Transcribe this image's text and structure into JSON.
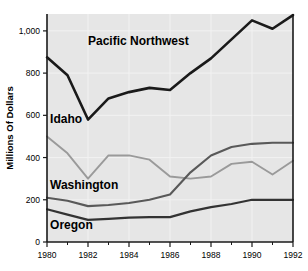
{
  "chart_data": {
    "type": "line",
    "title": "",
    "xlabel": "",
    "ylabel": "Millions Of Dollars",
    "x": [
      1980,
      1981,
      1982,
      1983,
      1984,
      1985,
      1986,
      1987,
      1988,
      1989,
      1990,
      1991,
      1992
    ],
    "xlim": [
      1980,
      1992
    ],
    "ylim": [
      0,
      1080
    ],
    "grid": true,
    "legend_position": "inline-labels",
    "y_ticks": [
      0,
      200,
      400,
      600,
      800,
      1000
    ],
    "y_tick_labels": [
      "0",
      "200",
      "400",
      "600",
      "800",
      "1,000"
    ],
    "x_ticks": [
      1980,
      1982,
      1984,
      1986,
      1988,
      1990,
      1992
    ],
    "x_tick_labels": [
      "1980",
      "1982",
      "1984",
      "1986",
      "1988",
      "1990",
      "1992"
    ],
    "x_minor_ticks": [
      1981,
      1983,
      1985,
      1987,
      1989,
      1991
    ],
    "series": [
      {
        "name": "Pacific Northwest",
        "label": "Pacific Northwest",
        "color": "#1a1a1a",
        "width": 2.6,
        "label_x": 1982.0,
        "label_y": 935,
        "values": [
          875,
          790,
          580,
          680,
          710,
          730,
          720,
          800,
          870,
          960,
          1050,
          1010,
          1075
        ]
      },
      {
        "name": "Idaho",
        "label": "Idaho",
        "color": "#9a9a9a",
        "width": 1.9,
        "label_x": 1980.15,
        "label_y": 565,
        "values": [
          500,
          420,
          300,
          410,
          410,
          390,
          310,
          300,
          310,
          370,
          380,
          320,
          385
        ]
      },
      {
        "name": "Washington",
        "label": "Washington",
        "color": "#595959",
        "width": 2.1,
        "label_x": 1980.15,
        "label_y": 253,
        "values": [
          210,
          195,
          170,
          175,
          185,
          200,
          225,
          330,
          410,
          450,
          465,
          470,
          470
        ]
      },
      {
        "name": "Oregon",
        "label": "Oregon",
        "color": "#333333",
        "width": 2.2,
        "label_x": 1980.15,
        "label_y": 62,
        "values": [
          155,
          130,
          105,
          110,
          115,
          118,
          118,
          145,
          165,
          180,
          200,
          200,
          200
        ]
      }
    ],
    "colors": {
      "plot_background": "#e6e6e6",
      "gridline": "#f2f2f2",
      "axis": "#1a1a1a",
      "page_background": "#ffffff"
    }
  }
}
